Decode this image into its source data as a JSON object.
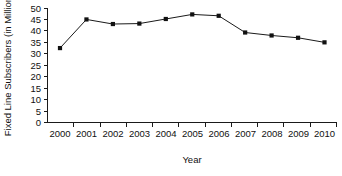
{
  "chart_data": {
    "type": "line",
    "title": "",
    "xlabel": "Year",
    "ylabel": "Fixed Line Subscribers (in Million)",
    "categories": [
      "2000",
      "2001",
      "2002",
      "2003",
      "2004",
      "2005",
      "2006",
      "2007",
      "2008",
      "2009",
      "2010"
    ],
    "values": [
      32.5,
      45,
      43,
      43.2,
      45.2,
      47.2,
      46.6,
      39.3,
      38,
      37,
      35
    ],
    "series": [
      {
        "name": "Fixed Line Subscribers",
        "values": [
          32.5,
          45,
          43,
          43.2,
          45.2,
          47.2,
          46.6,
          39.3,
          38,
          37,
          35
        ]
      }
    ],
    "ylim": [
      0,
      50
    ],
    "ytick_labels": [
      "0",
      "5",
      "10",
      "15",
      "20",
      "25",
      "30",
      "35",
      "40",
      "45",
      "50"
    ],
    "ytick_values": [
      0,
      5,
      10,
      15,
      20,
      25,
      30,
      35,
      40,
      45,
      50
    ],
    "xtick_labels": [
      "2000",
      "2001",
      "2002",
      "2003",
      "2004",
      "2005",
      "2006",
      "2007",
      "2008",
      "2009",
      "2010"
    ],
    "grid": false,
    "legend": "none",
    "marker": "square",
    "line_color": "#1a1a1a",
    "marker_color": "#111111",
    "background_color": "#ffffff"
  }
}
